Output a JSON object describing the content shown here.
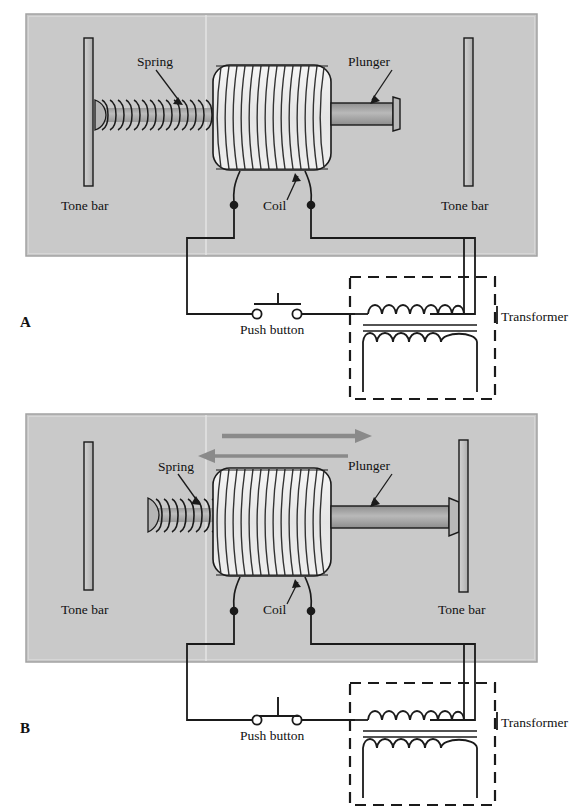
{
  "figure": {
    "panels": [
      {
        "id": "A",
        "panel_label": "A",
        "state": "at-rest",
        "labels": {
          "spring": "Spring",
          "plunger": "Plunger",
          "coil": "Coil",
          "tone_bar_left": "Tone bar",
          "tone_bar_right": "Tone bar",
          "push_button": "Push button",
          "transformer": "Transformer"
        },
        "switch_state": "closed",
        "arrows": []
      },
      {
        "id": "B",
        "panel_label": "B",
        "state": "energized",
        "labels": {
          "spring": "Spring",
          "plunger": "Plunger",
          "coil": "Coil",
          "tone_bar_left": "Tone bar",
          "tone_bar_right": "Tone bar",
          "push_button": "Push button",
          "transformer": "Transformer"
        },
        "switch_state": "open",
        "arrows": [
          {
            "name": "motion-arrow-right",
            "direction": "right"
          },
          {
            "name": "motion-arrow-left",
            "direction": "left"
          }
        ]
      }
    ]
  },
  "colors": {
    "panel_background": "#c9c9c9",
    "panel_border": "#9a9a9a",
    "line": "#1a1a1a",
    "tone_bar_fill": "#c0c0c0",
    "plunger_fill": "#a9a9a9",
    "coil_fill": "#eeeeee",
    "arrow_fill": "#8a8a8a",
    "shaft_fill": "#b3b3b3",
    "text": "#111111"
  },
  "components": {
    "transformer": {
      "primary_bumps": 6,
      "secondary_bumps": 5,
      "core_lines": 2,
      "enclosure": "dashed"
    },
    "coil": {
      "windings": 15,
      "terminals": 2
    },
    "spring": {
      "coils_at_rest": 14,
      "coils_stretched": 8
    }
  }
}
